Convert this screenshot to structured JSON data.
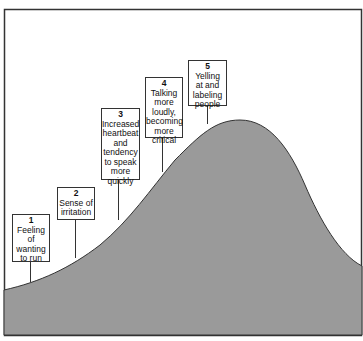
{
  "diagram": {
    "fill_color": "#9a9a9a",
    "stages": [
      {
        "number": "1",
        "label": "Feeling of\nwanting\nto run"
      },
      {
        "number": "2",
        "label": "Sense of\nirritation"
      },
      {
        "number": "3",
        "label": "Increased\nheartbeat\nand\ntendency\nto speak\nmore\nquickly"
      },
      {
        "number": "4",
        "label": "Talking\nmore\nloudly,\nbecoming\nmore\ncritical"
      },
      {
        "number": "5",
        "label": "Yelling\nat and\nlabeling\npeople"
      }
    ]
  }
}
